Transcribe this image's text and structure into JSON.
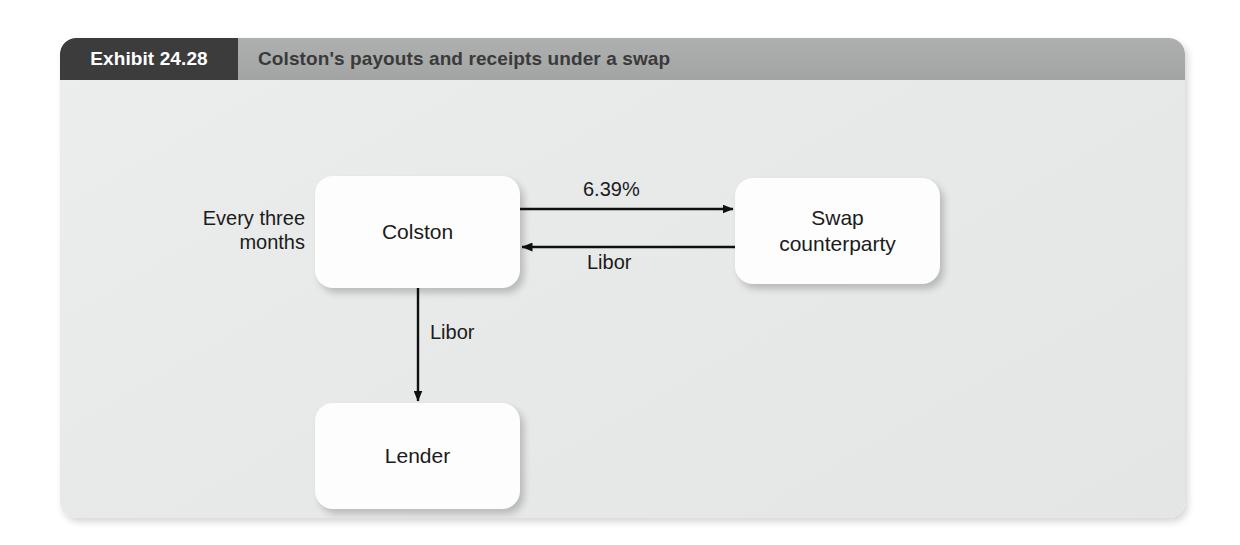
{
  "exhibit": {
    "number_label": "Exhibit 24.28",
    "title": "Colston's payouts and receipts under a swap"
  },
  "diagram": {
    "type": "flow-diagram",
    "nodes": [
      {
        "id": "colston",
        "label": "Colston"
      },
      {
        "id": "swap-counterparty",
        "label": "Swap\ncounterparty"
      },
      {
        "id": "lender",
        "label": "Lender"
      }
    ],
    "edges": [
      {
        "id": "colston-to-swap",
        "from": "colston",
        "to": "swap-counterparty",
        "label": "6.39%",
        "direction": "right"
      },
      {
        "id": "swap-to-colston",
        "from": "swap-counterparty",
        "to": "colston",
        "label": "Libor",
        "direction": "left"
      },
      {
        "id": "colston-to-lender",
        "from": "colston",
        "to": "lender",
        "label": "Libor",
        "direction": "down"
      }
    ],
    "annotations": [
      {
        "id": "frequency",
        "label": "Every three\nmonths"
      }
    ]
  },
  "colors": {
    "tab_background": "#3c3c3c",
    "header_background": "#a8a9a9",
    "panel_background": "#e8e9e9",
    "box_background": "#fdfdfd",
    "text": "#1b1b1b",
    "tab_text": "#ffffff"
  }
}
